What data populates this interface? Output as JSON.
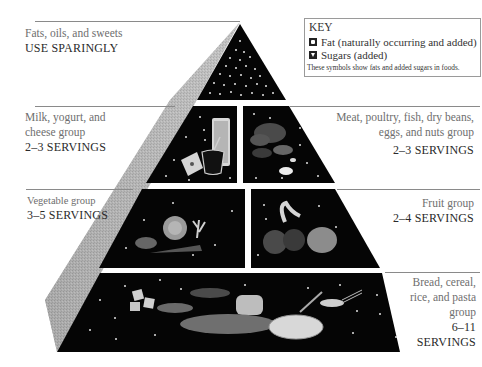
{
  "figure": {
    "type": "food-guide-pyramid",
    "tiers": [
      {
        "id": "fats",
        "label": "Fats, oils, and sweets",
        "servings": "USE SPARINGLY",
        "side": "left"
      },
      {
        "id": "dairy",
        "label_lines": [
          "Milk, yogurt, and",
          "cheese group"
        ],
        "servings": "2–3 SERVINGS",
        "side": "left"
      },
      {
        "id": "meat",
        "label_lines": [
          "Meat, poultry, fish, dry beans,",
          "eggs, and nuts group"
        ],
        "servings": "2–3 SERVINGS",
        "side": "right"
      },
      {
        "id": "vegetable",
        "label": "Vegetable group",
        "servings": "3–5 SERVINGS",
        "side": "left"
      },
      {
        "id": "fruit",
        "label": "Fruit group",
        "servings": "2–4 SERVINGS",
        "side": "right"
      },
      {
        "id": "grains",
        "label_lines": [
          "Bread, cereal,",
          "rice, and pasta",
          "group"
        ],
        "servings_lines": [
          "6–11",
          "SERVINGS"
        ],
        "side": "right"
      }
    ]
  },
  "key": {
    "title": "KEY",
    "items": [
      {
        "symbol": "fat-square-icon",
        "label": "Fat (naturally occurring and added)"
      },
      {
        "symbol": "sugar-triangle-icon",
        "label": "Sugars (added)"
      }
    ],
    "note": "These symbols show fats and added sugars in foods."
  },
  "colors": {
    "tier_fill": "#050505",
    "side_shade": "#a8a8a8",
    "label_gray": "#6e6e6e",
    "rule": "#8a8a8a"
  }
}
